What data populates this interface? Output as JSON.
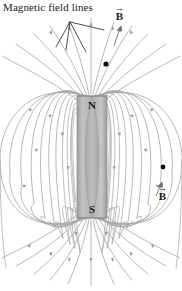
{
  "figure": {
    "width": 182,
    "height": 291,
    "background_color": "#ffffff"
  },
  "annotations": {
    "field_lines_label": "Magnetic field lines",
    "b_vector_top": "B",
    "b_vector_bottom": "B",
    "vector_arrow_glyph": "→"
  },
  "magnet": {
    "north_pole_label": "N",
    "south_pole_label": "S",
    "body_color": "#b4b4b4",
    "edge_color": "#8c8c8c",
    "x": 77,
    "y": 96,
    "width": 30,
    "height": 122
  },
  "field": {
    "line_color": "#a0a0a0",
    "arrow_color": "#9a9a9a",
    "marker_color": "#111111",
    "marker_points": [
      {
        "name": "field-point-upper",
        "x": 106,
        "y": 64
      },
      {
        "name": "field-point-lower",
        "x": 163,
        "y": 167
      }
    ]
  },
  "leader_lines": {
    "origin": {
      "x": 70,
      "y": 22
    },
    "color": "#2a2a2a"
  }
}
